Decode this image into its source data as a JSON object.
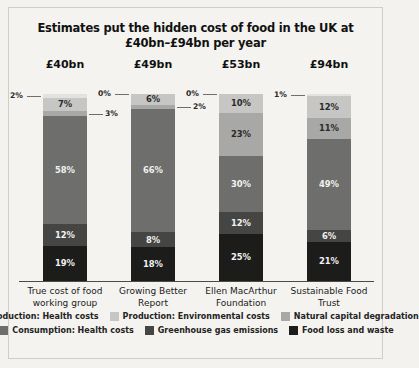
{
  "chart_data": {
    "type": "bar",
    "subtype": "stacked-percentage",
    "title": "Estimates put the hidden cost of food in the UK at £40bn–£94bn per year",
    "xlabel": "",
    "ylabel": "",
    "ylim": [
      0,
      100
    ],
    "grid": false,
    "legend_position": "bottom",
    "categories": [
      "True cost of food working group",
      "Growing Better Report",
      "Ellen MacArthur Foundation",
      "Sustainable Food Trust"
    ],
    "category_totals": [
      "£40bn",
      "£49bn",
      "£53bn",
      "£94bn"
    ],
    "series": [
      {
        "name": "Production: Health costs",
        "color": "#e2e2e0",
        "values": [
          2,
          0,
          0,
          1
        ]
      },
      {
        "name": "Production: Environmental costs",
        "color": "#c6c6c4",
        "values": [
          7,
          6,
          10,
          12
        ]
      },
      {
        "name": "Natural capital degradation",
        "color": "#a8a8a6",
        "values": [
          3,
          2,
          23,
          11
        ]
      },
      {
        "name": "Consumption: Health costs",
        "color": "#6e6e6c",
        "values": [
          58,
          66,
          30,
          49
        ]
      },
      {
        "name": "Greenhouse gas emissions",
        "color": "#454543",
        "values": [
          12,
          8,
          12,
          6
        ]
      },
      {
        "name": "Food loss and waste",
        "color": "#1c1c1a",
        "values": [
          19,
          18,
          25,
          21
        ]
      }
    ],
    "callouts": [
      {
        "column": 0,
        "series": "Production: Health costs",
        "label": "2%",
        "side": "left"
      },
      {
        "column": 0,
        "series": "Natural capital degradation",
        "label": "3%",
        "side": "right"
      },
      {
        "column": 1,
        "series": "Production: Health costs",
        "label": "0%",
        "side": "left"
      },
      {
        "column": 1,
        "series": "Natural capital degradation",
        "label": "2%",
        "side": "right"
      },
      {
        "column": 2,
        "series": "Production: Health costs",
        "label": "0%",
        "side": "left"
      },
      {
        "column": 3,
        "series": "Production: Health costs",
        "label": "1%",
        "side": "left"
      }
    ]
  }
}
